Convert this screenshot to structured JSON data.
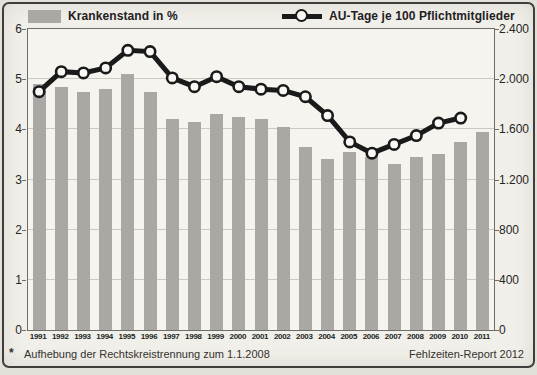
{
  "figure": {
    "legend": [
      {
        "label": "Krankenstand in %"
      },
      {
        "label": "AU-Tage je 100 Pflichtmitglieder"
      }
    ],
    "footnote_marker": "*",
    "footnote_text": "Aufhebung der Rechtskreistrennung zum 1.1.2008",
    "source_label": "Fehlzeiten-Report 2012"
  },
  "chart_data": {
    "type": "bar+line",
    "title": "",
    "categories": [
      "1991",
      "1992",
      "1993",
      "1994",
      "1995",
      "1996",
      "1997",
      "1998",
      "1999",
      "2000",
      "2001",
      "2002",
      "2003",
      "2004",
      "2005",
      "2006",
      "2007",
      "2008",
      "2009",
      "2010",
      "2011"
    ],
    "series": [
      {
        "name": "Krankenstand in %",
        "type": "bar",
        "axis": "left",
        "values": [
          4.9,
          4.85,
          4.75,
          4.8,
          5.1,
          4.75,
          4.2,
          4.15,
          4.3,
          4.25,
          4.2,
          4.05,
          3.65,
          3.4,
          3.55,
          3.45,
          3.3,
          3.45,
          3.5,
          3.75,
          3.95
        ]
      },
      {
        "name": "AU-Tage je 100 Pflichtmitglieder",
        "type": "line",
        "axis": "right",
        "values": [
          1900,
          2060,
          2050,
          2090,
          2230,
          2220,
          2010,
          1940,
          2020,
          1940,
          1920,
          1910,
          1860,
          1710,
          1500,
          1410,
          1480,
          1550,
          1650,
          1690,
          null
        ]
      }
    ],
    "left_axis": {
      "range": [
        0,
        6
      ],
      "ticks": [
        "0",
        "1",
        "2",
        "3",
        "4",
        "5",
        "6"
      ]
    },
    "right_axis": {
      "range": [
        0,
        2400
      ],
      "ticks": [
        "0",
        "400",
        "800",
        "1.200",
        "1.600",
        "2.000",
        "2.400"
      ]
    },
    "grid": "horizontal",
    "legend_position": "top",
    "colors": {
      "bar": "#a9a8a4",
      "line": "#1a1a1a",
      "marker_fill": "#faf8f4"
    }
  }
}
